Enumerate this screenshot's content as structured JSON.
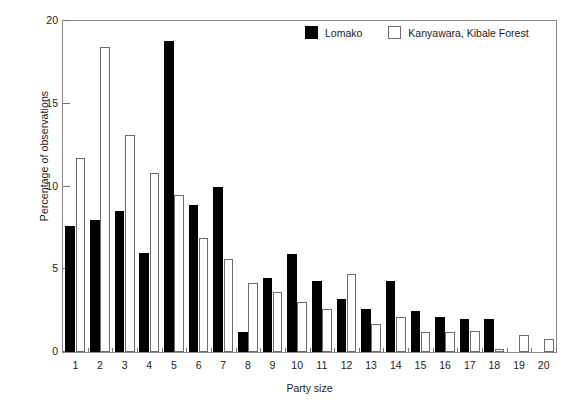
{
  "chart_data": {
    "type": "bar",
    "title": "",
    "xlabel": "Party size",
    "ylabel": "Percentage of observations",
    "categories": [
      "1",
      "2",
      "3",
      "4",
      "5",
      "6",
      "7",
      "8",
      "9",
      "10",
      "11",
      "12",
      "13",
      "14",
      "15",
      "16",
      "17",
      "18",
      "19",
      "20"
    ],
    "ylim": [
      0,
      20
    ],
    "yticks": [
      0,
      5,
      10,
      15,
      20
    ],
    "grid": false,
    "legend_position": "top-right",
    "series": [
      {
        "name": "Lomako",
        "color": "#000000",
        "values": [
          7.6,
          8.0,
          8.5,
          6.0,
          18.8,
          8.9,
          10.0,
          1.2,
          4.5,
          5.9,
          4.3,
          3.2,
          2.6,
          4.3,
          2.5,
          2.1,
          2.0,
          2.0,
          0.0,
          0.0
        ]
      },
      {
        "name": "Kanyawara, Kibale Forest",
        "color": "#ffffff",
        "values": [
          11.7,
          18.4,
          13.1,
          10.8,
          9.5,
          6.9,
          5.6,
          4.2,
          3.6,
          3.0,
          2.6,
          4.7,
          1.7,
          2.1,
          1.2,
          1.2,
          1.3,
          0.2,
          1.0,
          0.8
        ]
      }
    ]
  },
  "legend": {
    "items": [
      {
        "label": "Lomako"
      },
      {
        "label": "Kanyawara, Kibale Forest"
      }
    ]
  }
}
